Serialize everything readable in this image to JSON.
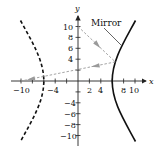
{
  "figure": {
    "type": "hyperbolic-mirror-diagram",
    "axes": {
      "x_label": "x",
      "y_label": "y",
      "x_ticks": [
        -10,
        -8,
        -6,
        -4,
        -2,
        2,
        4,
        6,
        8,
        10
      ],
      "x_tick_labels": [
        {
          "value": -10,
          "text": "−10"
        },
        {
          "value": -4,
          "text": "−4"
        },
        {
          "value": 2,
          "text": "2"
        },
        {
          "value": 4,
          "text": "4"
        },
        {
          "value": 8,
          "text": "8"
        },
        {
          "value": 10,
          "text": "10"
        }
      ],
      "y_ticks": [
        -10,
        -8,
        -6,
        -4,
        -2,
        2,
        4,
        6,
        8,
        10
      ],
      "y_tick_labels": [
        {
          "value": 10,
          "text": "10"
        },
        {
          "value": 8,
          "text": "8"
        },
        {
          "value": 6,
          "text": "6"
        },
        {
          "value": 4,
          "text": "4"
        },
        {
          "value": -4,
          "text": "−4"
        },
        {
          "value": -6,
          "text": "−6"
        },
        {
          "value": -8,
          "text": "−8"
        },
        {
          "value": -10,
          "text": "−10"
        }
      ]
    },
    "annotation": {
      "text": "Mirror"
    },
    "curves": {
      "right_branch": {
        "style": "solid",
        "role": "mirror"
      },
      "left_branch": {
        "style": "dashed"
      }
    },
    "rays": [
      {
        "from": [
          0,
          10
        ],
        "to": [
          6.55,
          3.5
        ],
        "style": "dashed-gray-arrow"
      },
      {
        "from": [
          6.55,
          3.5
        ],
        "to": [
          -10,
          0
        ],
        "style": "dashed-gray-arrow"
      }
    ],
    "colors": {
      "axis": "#222222",
      "curve": "#111111",
      "ray": "#9a9a9a"
    }
  }
}
